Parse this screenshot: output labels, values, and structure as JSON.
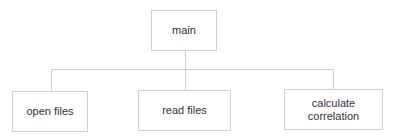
{
  "diagram": {
    "type": "hierarchy",
    "root": {
      "label": "main"
    },
    "children": [
      {
        "label": "open files"
      },
      {
        "label": "read files"
      },
      {
        "label": "calculate correlation",
        "label_lines": [
          "calculate",
          "correlation"
        ]
      }
    ],
    "colors": {
      "border": "#cfcfcf",
      "text": "#333333",
      "background": "#ffffff"
    }
  }
}
